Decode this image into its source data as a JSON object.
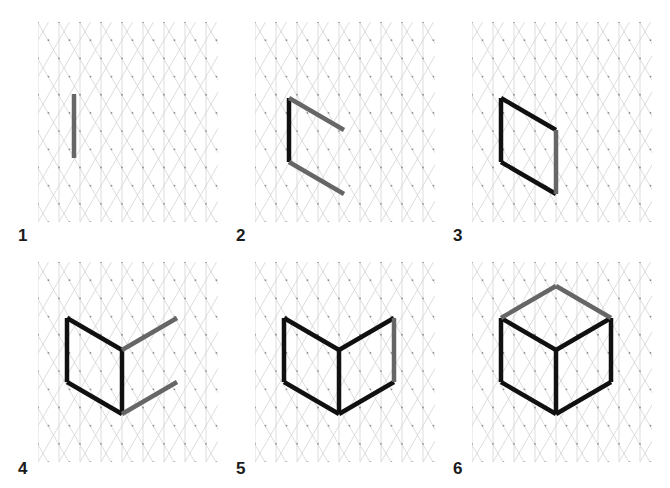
{
  "figure": {
    "background_color": "#ffffff",
    "width": 670,
    "height": 488
  },
  "grid": {
    "type": "isometric-triangular-dot-grid",
    "line_color": "#cfcfcf",
    "dot_color": "#8f8f8f",
    "cell_size_px": 21,
    "line_width_px": 0.7,
    "dot_radius_px": 0.9
  },
  "style": {
    "new_stroke_color": "#666666",
    "existing_stroke_color": "#101010",
    "stroke_width_px": 4.5,
    "label_color": "#1b1b1b"
  },
  "panels": [
    {
      "label": "1",
      "caption": "1",
      "description": "Single vertical edge drawn",
      "new_segments": 1,
      "existing_segments": 0,
      "total_segments": 1
    },
    {
      "label": "2",
      "caption": "2",
      "description": "Two diagonal edges added to the vertical edge",
      "new_segments": 2,
      "existing_segments": 1,
      "total_segments": 3
    },
    {
      "label": "3",
      "caption": "3",
      "description": "Closing vertical edge completes the left face rhombus",
      "new_segments": 1,
      "existing_segments": 3,
      "total_segments": 4
    },
    {
      "label": "4",
      "caption": "4",
      "description": "Two diagonal edges extend right from the rhombus",
      "new_segments": 2,
      "existing_segments": 4,
      "total_segments": 6
    },
    {
      "label": "5",
      "caption": "5",
      "description": "Right vertical edge closes the second face",
      "new_segments": 1,
      "existing_segments": 6,
      "total_segments": 7
    },
    {
      "label": "6",
      "caption": "6",
      "description": "Two top edges complete the isometric cube",
      "new_segments": 2,
      "existing_segments": 7,
      "total_segments": 9
    }
  ]
}
